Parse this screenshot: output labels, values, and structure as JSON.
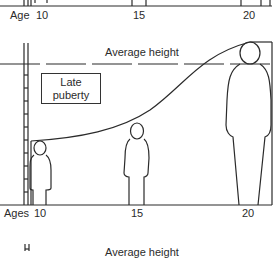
{
  "top_panel": {
    "axis_label": "Age",
    "ticks": [
      "10",
      "15",
      "20"
    ]
  },
  "main_panel": {
    "reference_line_label": "Average height",
    "annotation_box": [
      "Late",
      "puberty"
    ],
    "axis_label": "Ages",
    "ticks": [
      "10",
      "15",
      "20"
    ],
    "figures": [
      {
        "age": "10",
        "relative_size": "small"
      },
      {
        "age": "15",
        "relative_size": "medium"
      },
      {
        "age": "20",
        "relative_size": "tall"
      }
    ]
  },
  "bottom_panel": {
    "reference_line_label": "Average height"
  },
  "colors": {
    "line": "#2b2b2b",
    "background": "#ffffff"
  }
}
